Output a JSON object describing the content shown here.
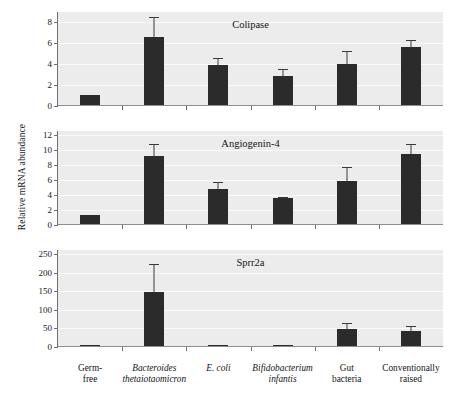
{
  "figure": {
    "y_axis_label": "Relative mRNA abundance"
  },
  "chart_data": [
    {
      "type": "bar",
      "title": "Colipase",
      "panel_index": 0,
      "xlabel": "",
      "ylabel": "Relative mRNA abundance",
      "ylim": [
        0,
        9
      ],
      "yticks": [
        0,
        2,
        4,
        6,
        8
      ],
      "grid": true,
      "legend": "none",
      "categories": [
        "Germ-free",
        "Bacteroides thetaiotaomicron",
        "E. coli",
        "Bifidobacterium infantis",
        "Gut bacteria",
        "Conventionally raised"
      ],
      "values": [
        1.0,
        6.5,
        3.85,
        2.8,
        3.95,
        5.6
      ],
      "errors": [
        0.0,
        2.0,
        0.75,
        0.75,
        1.3,
        0.75
      ]
    },
    {
      "type": "bar",
      "title": "Angiogenin-4",
      "panel_index": 1,
      "xlabel": "",
      "ylabel": "Relative mRNA abundance",
      "ylim": [
        0,
        12.6
      ],
      "yticks": [
        0,
        2,
        4,
        6,
        8,
        10,
        12
      ],
      "grid": true,
      "legend": "none",
      "categories": [
        "Germ-free",
        "Bacteroides thetaiotaomicron",
        "E. coli",
        "Bifidobacterium infantis",
        "Gut bacteria",
        "Conventionally raised"
      ],
      "values": [
        1.2,
        9.1,
        4.65,
        3.5,
        5.8,
        9.4
      ],
      "errors": [
        0.0,
        1.7,
        1.05,
        0.3,
        1.95,
        1.4
      ]
    },
    {
      "type": "bar",
      "title": "Sprr2a",
      "panel_index": 2,
      "xlabel": "",
      "ylabel": "Relative mRNA abundance",
      "ylim": [
        0,
        262
      ],
      "yticks": [
        0,
        50,
        100,
        150,
        200,
        250
      ],
      "grid": true,
      "legend": "none",
      "categories": [
        "Germ-free",
        "Bacteroides thetaiotaomicron",
        "E. coli",
        "Bifidobacterium infantis",
        "Gut bacteria",
        "Conventionally raised"
      ],
      "values": [
        2,
        145,
        3,
        3,
        45,
        40
      ],
      "errors": [
        0,
        80,
        0,
        0,
        20,
        18
      ]
    }
  ],
  "x_axis": {
    "categories": [
      {
        "line1": "Germ-",
        "line2": "free",
        "italic": false
      },
      {
        "line1": "Bacteroides",
        "line2": "thetaiotaomicron",
        "italic": true
      },
      {
        "line1": "E. coli",
        "line2": "",
        "italic": true
      },
      {
        "line1": "Bifidobacterium",
        "line2": "infantis",
        "italic": true
      },
      {
        "line1": "Gut",
        "line2": "bacteria",
        "italic": false
      },
      {
        "line1": "Conventionally",
        "line2": "raised",
        "italic": false
      }
    ]
  },
  "style": {
    "plot_background": "#ececec",
    "bar_color": "#2b2b2b",
    "axis_color": "#6e6e6e",
    "grid_color": "#fafafa",
    "text_color": "#141414"
  }
}
